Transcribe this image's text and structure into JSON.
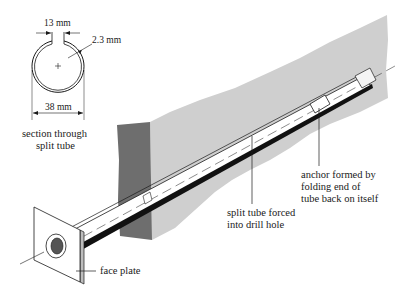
{
  "diagram": {
    "type": "technical-illustration",
    "colors": {
      "background": "#ffffff",
      "rock_face_light": "#cfcfcf",
      "rock_face_dark": "#6e6e6e",
      "line": "#1a1a1a"
    },
    "section": {
      "slot_width": "13 mm",
      "wall_thickness": "2.3 mm",
      "diameter": "38 mm",
      "caption_line1": "section through",
      "caption_line2": "split tube"
    },
    "labels": {
      "anchor_line1": "anchor formed by",
      "anchor_line2": "folding end of",
      "anchor_line3": "tube back on itself",
      "split_line1": "split tube forced",
      "split_line2": "into drill hole",
      "face_plate": "face plate"
    }
  }
}
